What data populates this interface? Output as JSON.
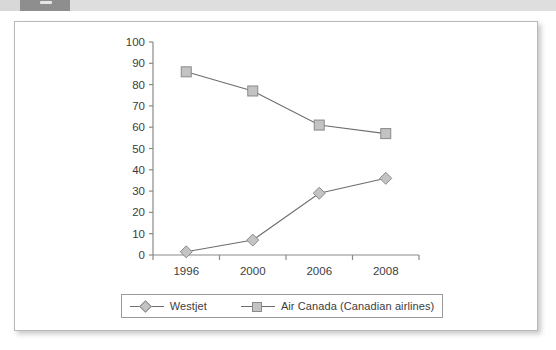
{
  "header": {
    "strip_present": true
  },
  "chart_data": {
    "type": "line",
    "title": "",
    "subtitle": "",
    "xlabel": "",
    "ylabel": "",
    "categories": [
      "1996",
      "2000",
      "2006",
      "2008"
    ],
    "ylim": [
      0,
      100
    ],
    "ytick_step": 10,
    "yticks": [
      "0",
      "10",
      "20",
      "30",
      "40",
      "50",
      "60",
      "70",
      "80",
      "90",
      "100"
    ],
    "grid": false,
    "legend_position": "bottom",
    "series": [
      {
        "name": "Westjet",
        "marker": "diamond",
        "values": [
          1.5,
          7,
          29,
          36
        ]
      },
      {
        "name": "Air Canada (Canadian airlines)",
        "marker": "square",
        "values": [
          86,
          77,
          61,
          57
        ]
      }
    ]
  },
  "legend": {
    "items": [
      {
        "label": "Westjet",
        "marker": "diamond"
      },
      {
        "label": "Air Canada (Canadian airlines)",
        "marker": "square"
      }
    ]
  },
  "colors": {
    "marker_fill": "#c3c3c3",
    "marker_stroke": "#8a8a8a",
    "line": "#6e6e6e",
    "axis": "#8a8a8a",
    "text": "#3d3d3d",
    "card_border": "#b9b9b9",
    "strip_dark": "#8e8e8e",
    "strip_light": "#dedede"
  }
}
